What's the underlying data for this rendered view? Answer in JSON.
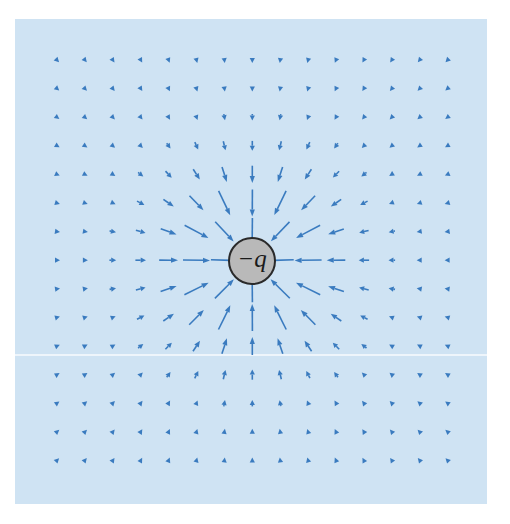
{
  "diagram": {
    "background_color": "#cfe3f3",
    "arrow_color": "#3a7bbf",
    "charge": {
      "label": "−q",
      "sign": "negative",
      "center": [
        252,
        261
      ],
      "radius": 23,
      "fill": "#b9b9b9",
      "stroke": "#2a2a2a"
    },
    "grid": {
      "columns": 15,
      "rows": 15,
      "origin": [
        57,
        60
      ],
      "spacing_x": 27.9,
      "spacing_y": 28.6
    },
    "arrows": {
      "direction": "inward",
      "max_length": 27,
      "min_length": 6,
      "falloff_scale": 55
    }
  }
}
